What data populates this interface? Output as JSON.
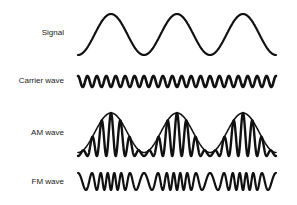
{
  "diagram": {
    "rows": [
      {
        "id": "signal",
        "label": "Signal",
        "label_y": 28
      },
      {
        "id": "carrier",
        "label": "Carrier wave",
        "label_y": 76
      },
      {
        "id": "am",
        "label": "AM wave",
        "label_y": 128
      },
      {
        "id": "fm",
        "label": "FM wave",
        "label_y": 177
      }
    ],
    "waves": {
      "x_start": 78,
      "x_end": 276,
      "signal": {
        "cycles": 3,
        "top": 14,
        "bottom": 55,
        "stroke_width": 2.2
      },
      "carrier": {
        "cycles": 21,
        "top": 76,
        "bottom": 87,
        "stroke_width": 2.6
      },
      "am": {
        "signal_cycles": 3,
        "carrier_cycles": 21,
        "top": 113,
        "bottom": 156,
        "min_amp_ratio": 0.08,
        "stroke_width": 2.4,
        "envelope_stroke_width": 1.6
      },
      "fm": {
        "signal_cycles": 3,
        "base_cycles": 21,
        "deviation": 0.45,
        "top": 173,
        "bottom": 190,
        "stroke_width": 2.2
      }
    },
    "colors": {
      "stroke": "#111111",
      "text": "#222222",
      "background": "#ffffff"
    }
  }
}
